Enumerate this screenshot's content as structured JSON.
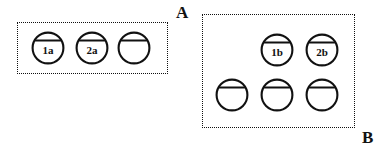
{
  "figure": {
    "background_color": "#ffffff",
    "ink_color": "#111111",
    "width": 388,
    "height": 151,
    "groups": [
      {
        "id": "group-a",
        "letter": "A",
        "letter_x": 176,
        "letter_y": 4,
        "box": {
          "x": 17,
          "y": 22,
          "width": 151,
          "height": 52
        },
        "tokens": [
          {
            "id": "a1",
            "label": "1a",
            "x": 48,
            "y": 48
          },
          {
            "id": "a2",
            "label": "2a",
            "x": 92,
            "y": 48
          },
          {
            "id": "a3",
            "label": "",
            "x": 134,
            "y": 48
          }
        ]
      },
      {
        "id": "group-b",
        "letter": "B",
        "letter_x": 362,
        "letter_y": 129,
        "box": {
          "x": 202,
          "y": 14,
          "width": 153,
          "height": 114
        },
        "tokens": [
          {
            "id": "b1",
            "label": "1b",
            "x": 277,
            "y": 50
          },
          {
            "id": "b2",
            "label": "2b",
            "x": 322,
            "y": 50
          },
          {
            "id": "b3",
            "label": "",
            "x": 232,
            "y": 95
          },
          {
            "id": "b4",
            "label": "",
            "x": 277,
            "y": 95
          },
          {
            "id": "b5",
            "label": "",
            "x": 322,
            "y": 95
          }
        ]
      }
    ]
  }
}
